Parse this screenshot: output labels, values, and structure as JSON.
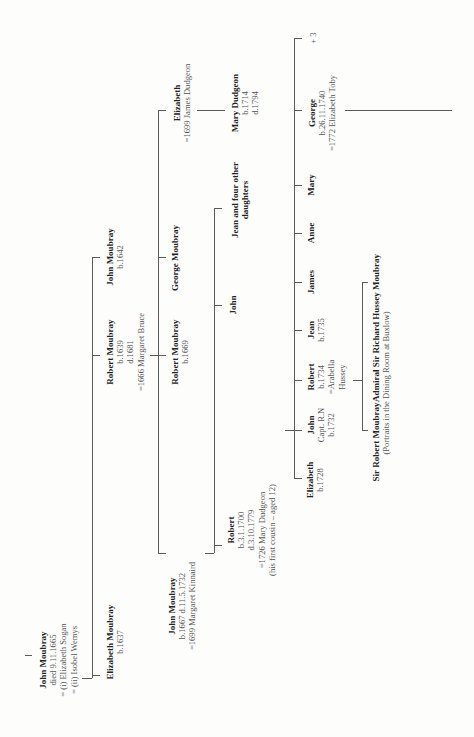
{
  "generations": [
    {
      "gen": 1,
      "people": [
        {
          "id": "john-moubray-1",
          "name": "John Moubray",
          "details": [
            "died 9.11.1665",
            "= (i) Elizabeth Sogan",
            "= (ii) Isobel Wemys"
          ]
        }
      ]
    },
    {
      "gen": 2,
      "people": [
        {
          "id": "elizabeth-moubray-1637",
          "name": "Elizabeth Moubray",
          "details": [
            "b.1637"
          ]
        },
        {
          "id": "robert-moubray-1639",
          "name": "Robert Moubray",
          "details": [
            "b.1639",
            "d.1681",
            "=1666 Margaret Bruce"
          ]
        },
        {
          "id": "john-moubray-1642",
          "name": "John Moubray",
          "details": [
            "b.1642"
          ]
        }
      ]
    },
    {
      "gen": 3,
      "people": [
        {
          "id": "john-moubray-1667",
          "name": "John Moubray",
          "details": [
            "b.1667 d.11.5.1732",
            "=1699 Margaret Kinnaird"
          ]
        },
        {
          "id": "robert-moubray-1669",
          "name": "Robert Moubray",
          "details": [
            "b.1669"
          ]
        },
        {
          "id": "george-moubray",
          "name": "George Moubray",
          "details": []
        },
        {
          "id": "elizabeth-dudgeon",
          "name": "Elizabeth",
          "details": [
            "=1699 James Dudgeon"
          ]
        }
      ]
    },
    {
      "gen": 4,
      "people": [
        {
          "id": "robert-1700",
          "name": "Robert",
          "details": [
            "b.3.1.1700",
            "d.3.10.1779",
            "=1726 Mary Dudgeon",
            "(his first cousin – aged 12)"
          ]
        },
        {
          "id": "john-gen4",
          "name": "John",
          "details": []
        },
        {
          "id": "jean-and-daughters",
          "name": "Jean and four other",
          "name2": "daughters",
          "details": []
        },
        {
          "id": "mary-dudgeon",
          "name": "Mary Dudgeon",
          "details": [
            "b.1714",
            "d.1794"
          ]
        }
      ]
    },
    {
      "gen": 5,
      "people": [
        {
          "id": "elizabeth-1728",
          "name": "Elizabeth",
          "details": [
            "b.1728"
          ]
        },
        {
          "id": "john-1732",
          "name": "John",
          "details": [
            "Capt. R.N",
            "b.1732"
          ]
        },
        {
          "id": "robert-1734",
          "name": "Robert",
          "details": [
            "b.1734",
            "=Arabella",
            "Hussey"
          ]
        },
        {
          "id": "jean-1735",
          "name": "Jean",
          "details": [
            "b.1735"
          ]
        },
        {
          "id": "james",
          "name": "James",
          "details": []
        },
        {
          "id": "anne",
          "name": "Anne",
          "details": []
        },
        {
          "id": "mary",
          "name": "Mary",
          "details": []
        },
        {
          "id": "george-1740",
          "name": "George",
          "details": [
            "b.26.11.1740",
            "=1772 Elizabeth Toby"
          ]
        },
        {
          "id": "plus-three",
          "name": "",
          "details": [
            "+ 3"
          ]
        }
      ]
    },
    {
      "gen": 6,
      "people": [
        {
          "id": "sir-robert-moubray",
          "name": "Sir Robert Moubray",
          "details": []
        },
        {
          "id": "admiral-sir-richard",
          "name": "Admiral Sir Richard Hussey Moubray",
          "details": []
        }
      ],
      "note": "(Portraits in the Dining Room at Buxlow)"
    }
  ],
  "colors": {
    "line": "#5a5a5a",
    "name": "#222222",
    "info": "#555555",
    "background": "#fdfdfc"
  }
}
